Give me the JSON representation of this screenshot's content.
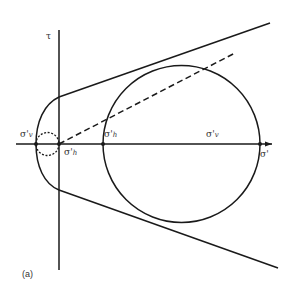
{
  "diagram": {
    "type": "mohr-circle-failure-envelope",
    "caption": "(a)",
    "axes": {
      "vertical_label": "τ",
      "horizontal_label": "σ'"
    },
    "points": [
      {
        "id": "sigma_v_left",
        "label": "σ'",
        "subscript": "v"
      },
      {
        "id": "sigma_h_origin",
        "label": "σ'",
        "subscript": "h"
      },
      {
        "id": "sigma_h_mid",
        "label": "σ'",
        "subscript": "h"
      },
      {
        "id": "sigma_v_right",
        "label": "σ'",
        "subscript": "v"
      }
    ],
    "elements": [
      "large solid Mohr circle",
      "small dotted Mohr circle",
      "dashed stress path line",
      "upper failure envelope",
      "lower failure envelope",
      "curved tension cut-off"
    ],
    "colors": {
      "line": "#1a1a1a",
      "text": "#333333",
      "background": "#ffffff"
    }
  }
}
